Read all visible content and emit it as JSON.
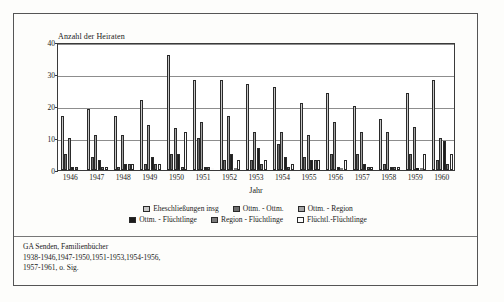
{
  "chart_data": {
    "type": "bar",
    "title": "",
    "ylabel": "Anzahl der Heiraten",
    "xlabel": "Jahr",
    "ylim": [
      0,
      40
    ],
    "yticks": [
      0,
      10,
      20,
      30,
      40
    ],
    "grid": true,
    "legend_position": "bottom",
    "categories": [
      "1946",
      "1947",
      "1948",
      "1949",
      "1950",
      "1951",
      "1952",
      "1953",
      "1954",
      "1955",
      "1956",
      "1957",
      "1958",
      "1959",
      "1960"
    ],
    "series": [
      {
        "name": "Eheschließungen insg",
        "color": "#c9c9c9",
        "values": [
          17,
          19,
          17,
          22,
          36,
          28,
          28,
          27,
          26,
          21,
          24,
          20,
          16,
          24,
          28
        ]
      },
      {
        "name": "Ottm. - Ottm.",
        "color": "#6e6e6e",
        "values": [
          5,
          4,
          1,
          2,
          5,
          10,
          3,
          3,
          8,
          4,
          5,
          5,
          2,
          5,
          3
        ]
      },
      {
        "name": "Ottm. - Region",
        "color": "#a5a5a5",
        "values": [
          10,
          11,
          11,
          14,
          13,
          15,
          17,
          12,
          12,
          11,
          15,
          12,
          12,
          13.5,
          10
        ]
      },
      {
        "name": "Ottm. - Flüchtlinge",
        "color": "#1c1c1c",
        "values": [
          1,
          3,
          2,
          4,
          5,
          1,
          5,
          7,
          4,
          3,
          1,
          2,
          1,
          0,
          9
        ]
      },
      {
        "name": "Region - Flüchtlinge",
        "color": "#7c7c7c",
        "values": [
          1,
          1,
          2,
          2,
          1,
          1,
          0,
          2,
          1,
          3,
          0,
          1,
          1,
          0,
          2
        ]
      },
      {
        "name": "Flüchtl.-Flüchtlinge",
        "color": "#fbfbfb",
        "values": [
          0,
          1,
          2,
          2,
          12,
          0,
          3,
          3,
          2,
          3,
          3,
          1,
          1,
          5,
          5
        ]
      }
    ]
  },
  "caption": {
    "line1": "GA Senden, Familienbücher",
    "line2": "1938-1946,1947-1950,1951-1953,1954-1956,",
    "line3": "1957-1961, o. Sig."
  }
}
